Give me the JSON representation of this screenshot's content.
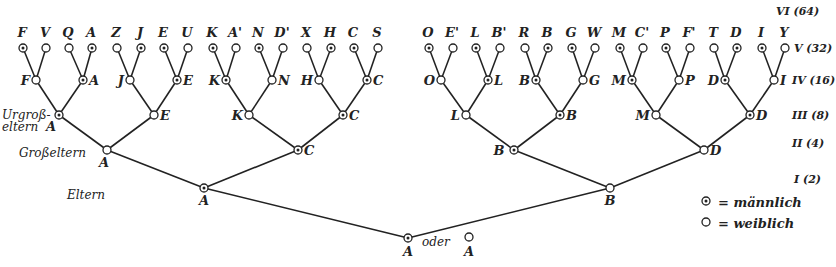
{
  "legend": {
    "male_symbol": "⊙",
    "male_label": "= männlich",
    "female_symbol": "○",
    "female_label": "= weiblich"
  },
  "generation_labels": [
    {
      "id": "VI",
      "text": "VI (64)"
    },
    {
      "id": "V",
      "text": "V (32)"
    },
    {
      "id": "IV",
      "text": "IV (16)"
    },
    {
      "id": "III",
      "text": "III (8)"
    },
    {
      "id": "II",
      "text": "II (4)"
    },
    {
      "id": "I",
      "text": "I (2)"
    }
  ],
  "side_labels": {
    "urgrosseltern_1": "Urgroß-",
    "urgrosseltern_2": "eltern",
    "grosseltern": "Großeltern",
    "eltern": "Eltern",
    "oder": "oder"
  },
  "root": {
    "label": "A",
    "sex": "m",
    "alt_label": "A",
    "alt_sex": "f"
  },
  "tree": {
    "label": "A",
    "sex": "m",
    "children": [
      {
        "label": "A",
        "sex": "m",
        "children": [
          {
            "label": "A",
            "sex": "f",
            "children": [
              {
                "label": "A",
                "sex": "m",
                "children": [
                  {
                    "label": "F",
                    "sex": "f",
                    "children": [
                      {
                        "label": "F",
                        "sex": "m"
                      },
                      {
                        "label": "V",
                        "sex": "f"
                      }
                    ]
                  },
                  {
                    "label": "A",
                    "sex": "m",
                    "children": [
                      {
                        "label": "Q",
                        "sex": "f"
                      },
                      {
                        "label": "A",
                        "sex": "m"
                      }
                    ]
                  }
                ]
              },
              {
                "label": "E",
                "sex": "f",
                "children": [
                  {
                    "label": "J",
                    "sex": "f",
                    "children": [
                      {
                        "label": "Z",
                        "sex": "f"
                      },
                      {
                        "label": "J",
                        "sex": "m"
                      }
                    ]
                  },
                  {
                    "label": "E",
                    "sex": "m",
                    "children": [
                      {
                        "label": "E",
                        "sex": "m"
                      },
                      {
                        "label": "U",
                        "sex": "f"
                      }
                    ]
                  }
                ]
              }
            ]
          },
          {
            "label": "C",
            "sex": "m",
            "children": [
              {
                "label": "K",
                "sex": "f",
                "children": [
                  {
                    "label": "K",
                    "sex": "m",
                    "children": [
                      {
                        "label": "K",
                        "sex": "m"
                      },
                      {
                        "label": "A'",
                        "sex": "f"
                      }
                    ]
                  },
                  {
                    "label": "N",
                    "sex": "f",
                    "children": [
                      {
                        "label": "N",
                        "sex": "m"
                      },
                      {
                        "label": "D'",
                        "sex": "f"
                      }
                    ]
                  }
                ]
              },
              {
                "label": "C",
                "sex": "m",
                "children": [
                  {
                    "label": "H",
                    "sex": "f",
                    "children": [
                      {
                        "label": "X",
                        "sex": "f"
                      },
                      {
                        "label": "H",
                        "sex": "m"
                      }
                    ]
                  },
                  {
                    "label": "C",
                    "sex": "m",
                    "children": [
                      {
                        "label": "C",
                        "sex": "m"
                      },
                      {
                        "label": "S",
                        "sex": "f"
                      }
                    ]
                  }
                ]
              }
            ]
          }
        ]
      },
      {
        "label": "B",
        "sex": "f",
        "children": [
          {
            "label": "B",
            "sex": "m",
            "children": [
              {
                "label": "L",
                "sex": "f",
                "children": [
                  {
                    "label": "O",
                    "sex": "f",
                    "children": [
                      {
                        "label": "O",
                        "sex": "m"
                      },
                      {
                        "label": "E'",
                        "sex": "f"
                      }
                    ]
                  },
                  {
                    "label": "L",
                    "sex": "m",
                    "children": [
                      {
                        "label": "L",
                        "sex": "m"
                      },
                      {
                        "label": "B'",
                        "sex": "f"
                      }
                    ]
                  }
                ]
              },
              {
                "label": "B",
                "sex": "m",
                "children": [
                  {
                    "label": "B",
                    "sex": "m",
                    "children": [
                      {
                        "label": "R",
                        "sex": "f"
                      },
                      {
                        "label": "B",
                        "sex": "m"
                      }
                    ]
                  },
                  {
                    "label": "G",
                    "sex": "f",
                    "children": [
                      {
                        "label": "G",
                        "sex": "m"
                      },
                      {
                        "label": "W",
                        "sex": "f"
                      }
                    ]
                  }
                ]
              }
            ]
          },
          {
            "label": "D",
            "sex": "f",
            "children": [
              {
                "label": "M",
                "sex": "f",
                "children": [
                  {
                    "label": "M",
                    "sex": "m",
                    "children": [
                      {
                        "label": "M",
                        "sex": "m"
                      },
                      {
                        "label": "C'",
                        "sex": "f"
                      }
                    ]
                  },
                  {
                    "label": "P",
                    "sex": "f",
                    "children": [
                      {
                        "label": "P",
                        "sex": "m"
                      },
                      {
                        "label": "F'",
                        "sex": "f"
                      }
                    ]
                  }
                ]
              },
              {
                "label": "D",
                "sex": "m",
                "children": [
                  {
                    "label": "D",
                    "sex": "m",
                    "children": [
                      {
                        "label": "T",
                        "sex": "f"
                      },
                      {
                        "label": "D",
                        "sex": "m"
                      }
                    ]
                  },
                  {
                    "label": "I",
                    "sex": "f",
                    "children": [
                      {
                        "label": "I",
                        "sex": "m"
                      },
                      {
                        "label": "Y",
                        "sex": "f"
                      }
                    ]
                  }
                ]
              }
            ]
          }
        ]
      }
    ]
  }
}
